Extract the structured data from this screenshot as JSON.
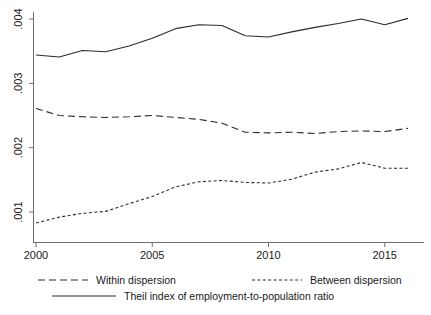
{
  "chart_data": {
    "type": "line",
    "title": "",
    "subtitle": "",
    "xlabel": "",
    "ylabel": "",
    "x": [
      2000,
      2001,
      2002,
      2003,
      2004,
      2005,
      2006,
      2007,
      2008,
      2009,
      2010,
      2011,
      2012,
      2013,
      2014,
      2015,
      2016
    ],
    "xlim": [
      2000,
      2016
    ],
    "ylim": [
      0.0007,
      0.00415
    ],
    "xticks": [
      2000,
      2005,
      2010,
      2015
    ],
    "xtick_labels": [
      "2000",
      "2005",
      "2010",
      "2015"
    ],
    "yticks": [
      0.001,
      0.002,
      0.003,
      0.004
    ],
    "ytick_labels": [
      ".001",
      ".002",
      ".003",
      ".004"
    ],
    "grid": false,
    "legend_position": "bottom",
    "series": [
      {
        "name": "Within dispersion",
        "style": "long-dash",
        "color": "#2b2b2b",
        "values": [
          0.00261,
          0.0025,
          0.00248,
          0.00247,
          0.00248,
          0.0025,
          0.00247,
          0.00244,
          0.00238,
          0.00224,
          0.00223,
          0.00224,
          0.00222,
          0.00225,
          0.00226,
          0.00225,
          0.0023
        ]
      },
      {
        "name": "Between dispersion",
        "style": "short-dash",
        "color": "#2b2b2b",
        "values": [
          0.00083,
          0.00092,
          0.00098,
          0.00101,
          0.00113,
          0.00124,
          0.00139,
          0.00147,
          0.00149,
          0.00146,
          0.00145,
          0.00151,
          0.00162,
          0.00167,
          0.00177,
          0.00168,
          0.00168
        ]
      },
      {
        "name": "Theil index of employment-to-population ratio",
        "style": "solid",
        "color": "#2b2b2b",
        "values": [
          0.00344,
          0.00341,
          0.00351,
          0.00349,
          0.00358,
          0.0037,
          0.00385,
          0.00391,
          0.0039,
          0.00374,
          0.00372,
          0.0038,
          0.00387,
          0.00393,
          0.004,
          0.00391,
          0.00401
        ]
      }
    ],
    "legend": [
      {
        "label": "Within dispersion",
        "style": "long-dash"
      },
      {
        "label": "Between dispersion",
        "style": "short-dash"
      },
      {
        "label": "Theil index of employment-to-population ratio",
        "style": "solid"
      }
    ]
  }
}
